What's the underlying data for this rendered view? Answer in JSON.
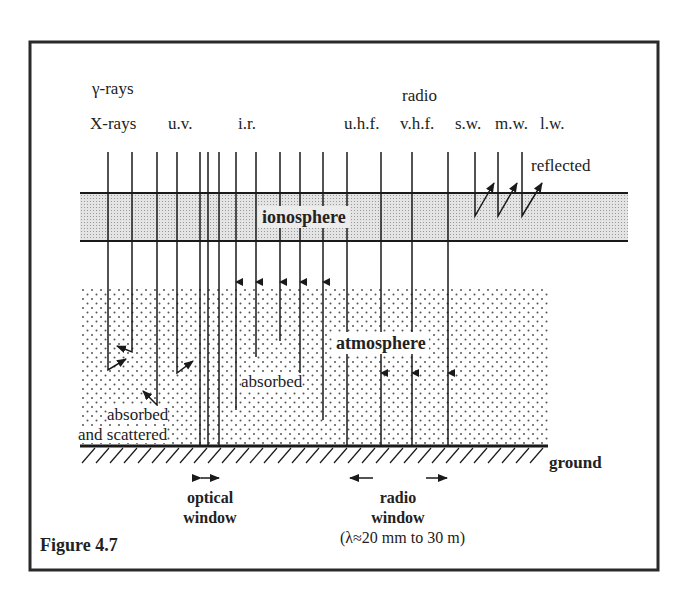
{
  "figure": {
    "caption": "Figure 4.7"
  },
  "bands": {
    "gamma": "γ-rays",
    "xrays": "X-rays",
    "uv": "u.v.",
    "ir": "i.r.",
    "radio_group": "radio",
    "uhf": "u.h.f.",
    "vhf": "v.h.f.",
    "sw": "s.w.",
    "mw": "m.w.",
    "lw": "l.w."
  },
  "layers": {
    "ionosphere": "ionosphere",
    "atmosphere": "atmosphere",
    "ground": "ground"
  },
  "annotations": {
    "reflected": "reflected",
    "absorbed_ir": "absorbed",
    "absorbed_scattered_1": "absorbed",
    "absorbed_scattered_2": "and scattered"
  },
  "windows": {
    "optical_1": "optical",
    "optical_2": "window",
    "radio_1": "radio",
    "radio_2": "window",
    "radio_range": "(λ≈20 mm to 30 m)"
  },
  "colors": {
    "ink": "#1a1a1a",
    "ionosphere_fill": "#d9d9d9",
    "frame": "#2a2a2a"
  }
}
